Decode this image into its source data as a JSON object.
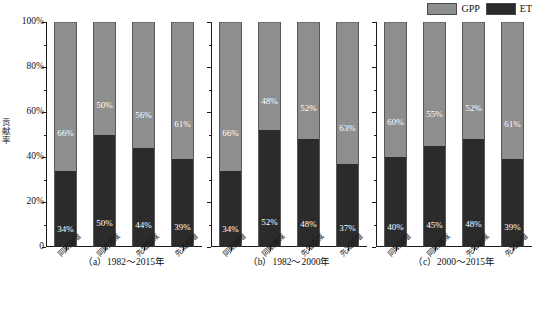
{
  "chart_data": {
    "type": "bar",
    "title": "",
    "subtitle": "",
    "stacked": true,
    "stacked_total": 100,
    "xlabel": "",
    "ylabel": "贡献率",
    "ylim": [
      0,
      100
    ],
    "yticks": [
      "0",
      "20%",
      "40%",
      "60%",
      "80%",
      "100%"
    ],
    "ytick_values": [
      0,
      20,
      40,
      60,
      80,
      100
    ],
    "grid": false,
    "legend_position": "top-right",
    "legend": [
      {
        "name": "GPP",
        "color": "#8e8e8e"
      },
      {
        "name": "ET",
        "color": "#2b2b2b"
      }
    ],
    "categories": [
      "同期递增",
      "同期递减",
      "先增后减",
      "先减后增"
    ],
    "panels": [
      {
        "id": "a",
        "caption": "（a）1982～2015年",
        "series": [
          {
            "name": "ET",
            "values": [
              34,
              50,
              44,
              39
            ],
            "labels": [
              "34%",
              "50%",
              "44%",
              "39%"
            ]
          },
          {
            "name": "GPP",
            "values": [
              66,
              50,
              56,
              61
            ],
            "labels": [
              "66%",
              "50%",
              "56%",
              "61%"
            ]
          }
        ]
      },
      {
        "id": "b",
        "caption": "（b）1982～2000年",
        "series": [
          {
            "name": "ET",
            "values": [
              34,
              52,
              48,
              37
            ],
            "labels": [
              "34%",
              "52%",
              "48%",
              "37%"
            ]
          },
          {
            "name": "GPP",
            "values": [
              66,
              48,
              52,
              63
            ],
            "labels": [
              "66%",
              "48%",
              "52%",
              "63%"
            ]
          }
        ]
      },
      {
        "id": "c",
        "caption": "（c）2000～2015年",
        "series": [
          {
            "name": "ET",
            "values": [
              40,
              45,
              48,
              39
            ],
            "labels": [
              "40%",
              "45%",
              "48%",
              "39%"
            ]
          },
          {
            "name": "GPP",
            "values": [
              60,
              55,
              52,
              61
            ],
            "labels": [
              "60%",
              "55%",
              "52%",
              "61%"
            ]
          }
        ]
      }
    ],
    "colors": {
      "gpp": "#8e8e8e",
      "et": "#2b2b2b",
      "axis": "#1a1a1a",
      "background": "#ffffff",
      "label_text": "#ffffff"
    }
  }
}
